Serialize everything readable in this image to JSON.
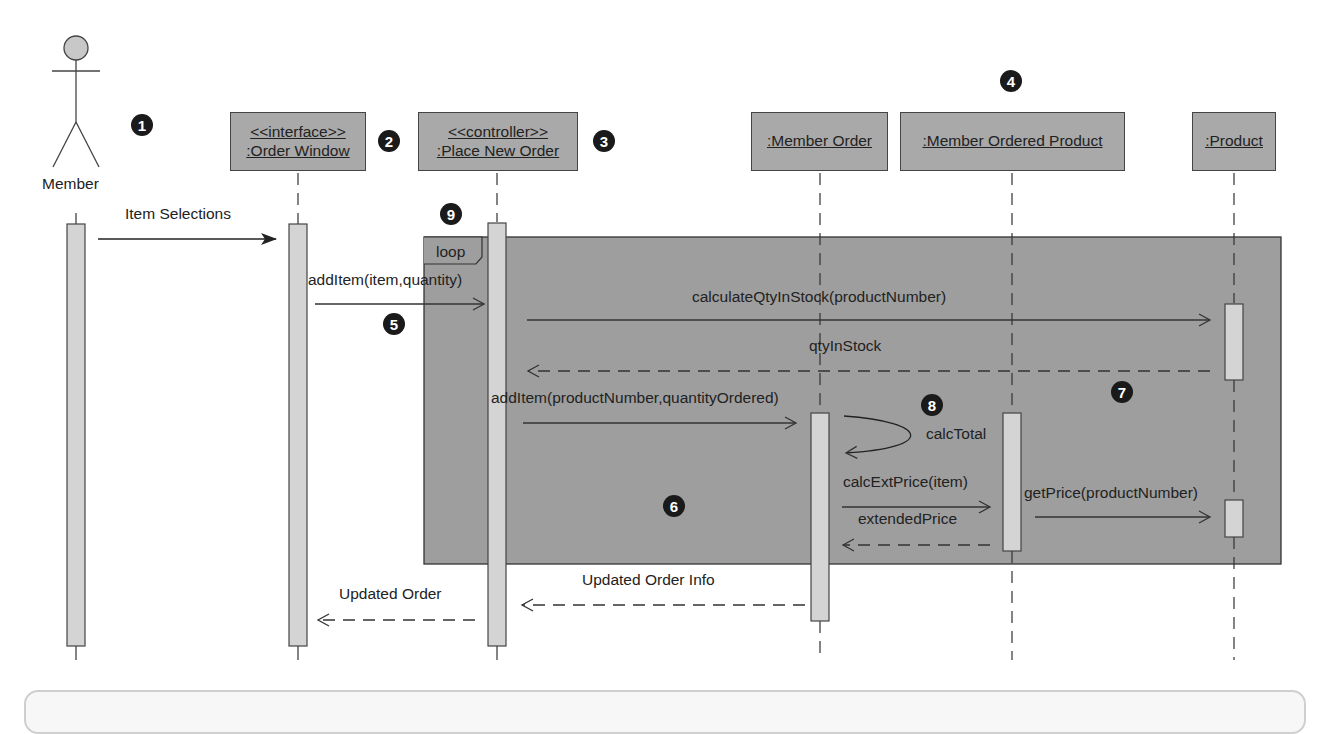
{
  "diagram": {
    "type": "UML sequence diagram",
    "actor": {
      "label": "Member"
    },
    "objects": [
      {
        "stereotype": "<<interface>>",
        "name": ":Order Window"
      },
      {
        "stereotype": "<<controller>>",
        "name": ":Place New Order"
      },
      {
        "stereotype": "",
        "name": ":Member Order"
      },
      {
        "stereotype": "",
        "name": ":Member Ordered Product"
      },
      {
        "stereotype": "",
        "name": ":Product"
      }
    ],
    "fragment": {
      "operator": "loop"
    },
    "messages": [
      {
        "label": "Item Selections",
        "kind": "sync"
      },
      {
        "label": "addItem(item,quantity)",
        "kind": "sync"
      },
      {
        "label": "calculateQtyInStock(productNumber)",
        "kind": "sync"
      },
      {
        "label": "qtyInStock",
        "kind": "return"
      },
      {
        "label": "addItem(productNumber,quantityOrdered)",
        "kind": "sync"
      },
      {
        "label": "calcTotal",
        "kind": "self"
      },
      {
        "label": "calcExtPrice(item)",
        "kind": "sync"
      },
      {
        "label": "extendedPrice",
        "kind": "return"
      },
      {
        "label": "getPrice(productNumber)",
        "kind": "sync"
      },
      {
        "label": "Updated Order Info",
        "kind": "return"
      },
      {
        "label": "Updated Order",
        "kind": "return"
      }
    ],
    "callouts": [
      "1",
      "2",
      "3",
      "4",
      "5",
      "6",
      "7",
      "8",
      "9"
    ]
  },
  "colors": {
    "object_fill": "#a9a9a9",
    "loop_fill": "#9e9e9e",
    "activation_fill": "#d4d4d4",
    "badge": "#1a1a1a"
  }
}
